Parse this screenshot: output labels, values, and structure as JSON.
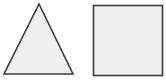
{
  "diagram": {
    "shapes": [
      {
        "type": "triangle",
        "points": "39,4 4,74 73,74",
        "fill": "#f0f0f0",
        "stroke": "#3a3a3a"
      },
      {
        "type": "square",
        "x": 93,
        "y": 5,
        "width": 70,
        "height": 70,
        "fill": "#f0f0f0",
        "stroke": "#3a3a3a"
      }
    ]
  }
}
